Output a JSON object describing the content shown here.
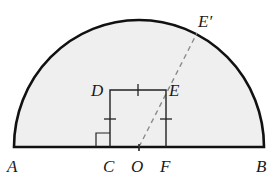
{
  "diagram": {
    "type": "geometry",
    "colors": {
      "fill": "#efefef",
      "stroke": "#111111",
      "dashed": "#888888"
    },
    "labels": {
      "A": "A",
      "B": "B",
      "C": "C",
      "O": "O",
      "F": "F",
      "D": "D",
      "E": "E",
      "E_prime": "E′"
    },
    "points": {
      "A": [
        14,
        147
      ],
      "B": [
        264,
        147
      ],
      "O": [
        139,
        147
      ],
      "C": [
        110,
        147
      ],
      "F": [
        166,
        147
      ],
      "D": [
        110,
        90
      ],
      "E": [
        166,
        90
      ],
      "E_prime": [
        197,
        35
      ]
    },
    "marks": {
      "right_angle_at": "C",
      "equal_side_ticks": [
        "DE",
        "DC",
        "EF"
      ],
      "tick_at": "O"
    }
  }
}
